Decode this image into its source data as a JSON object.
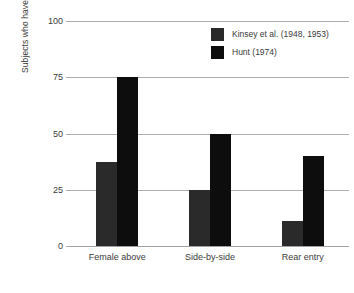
{
  "chart_data": {
    "type": "bar",
    "title": "",
    "subtitle": "",
    "xlabel": "",
    "ylabel": "Subjects who have used position (%)",
    "categories": [
      "Female above",
      "Side-by-side",
      "Rear entry"
    ],
    "series": [
      {
        "name": "Kinsey et al. (1948, 1953)",
        "color": "#2a2a2a",
        "values": [
          37.5,
          25,
          11
        ]
      },
      {
        "name": "Hunt (1974)",
        "color": "#0d0d0d",
        "values": [
          75,
          50,
          40
        ]
      }
    ],
    "ylim": [
      0,
      100
    ],
    "yticks": [
      0,
      25,
      50,
      75,
      100
    ],
    "ytick_labels": [
      "0",
      "25",
      "50",
      "75",
      "100"
    ],
    "grid": "horizontal",
    "legend_position": "top-right",
    "gridline_color": "#adadad",
    "background_color": "#ffffff",
    "text_color": "#3b3b3b"
  }
}
